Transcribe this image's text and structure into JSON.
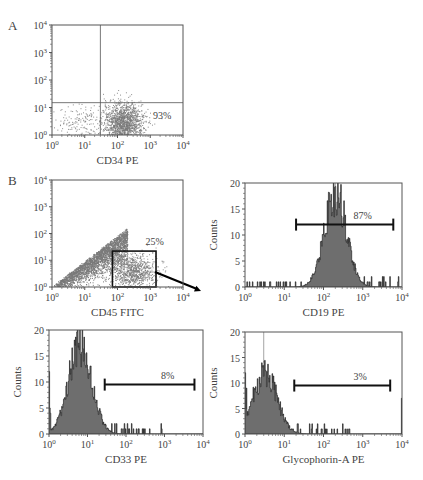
{
  "figure": {
    "panel_labels": [
      "A",
      "B"
    ],
    "colors": {
      "frame": "#555555",
      "scatter": "#7a7a7a",
      "hist_fill": "#6e6e6e",
      "hist_edge": "#111111",
      "gate": "#111111",
      "text": "#444444"
    }
  },
  "chart_data": [
    {
      "id": "A",
      "type": "scatter",
      "panel_label": "A",
      "title": "",
      "xlabel": "CD34 PE",
      "ylabel": "",
      "xscale": "log",
      "yscale": "log",
      "xlim": [
        1,
        10000
      ],
      "ylim": [
        1,
        10000
      ],
      "xticks": [
        "10^0",
        "10^1",
        "10^2",
        "10^3",
        "10^4"
      ],
      "yticks": [
        "10^0",
        "10^1",
        "10^2",
        "10^3",
        "10^4"
      ],
      "quadrant_lines": {
        "x": 30,
        "y": 15
      },
      "annotation": {
        "text": "93%",
        "quadrant": "lower-right"
      },
      "populations": [
        {
          "name": "main cluster",
          "center_x": 150,
          "center_y": 3,
          "spread_decades_x": 0.3,
          "spread_decades_y": 0.35,
          "n": 1400
        },
        {
          "name": "low tail",
          "center_x": 8,
          "center_y": 3,
          "spread_decades_x": 0.45,
          "spread_decades_y": 0.3,
          "n": 160
        }
      ]
    },
    {
      "id": "B1",
      "type": "scatter",
      "panel_label": "B",
      "title": "",
      "xlabel": "CD45 FITC",
      "ylabel": "",
      "xscale": "log",
      "yscale": "log",
      "xlim": [
        1,
        10000
      ],
      "ylim": [
        1,
        10000
      ],
      "xticks": [
        "10^0",
        "10^1",
        "10^2",
        "10^3",
        "10^4"
      ],
      "yticks": [
        "10^0",
        "10^1",
        "10^2",
        "10^3",
        "10^4"
      ],
      "gate": {
        "x0": 70,
        "x1": 1500,
        "y0": 1,
        "y1": 22,
        "label": "25%"
      },
      "arrow": {
        "from": "gate",
        "to": "CD19 PE histogram"
      },
      "populations": [
        {
          "name": "diagonal band",
          "type": "diagonal",
          "x_range": [
            1,
            200
          ],
          "n": 2600
        },
        {
          "name": "gated cluster",
          "center_x": 300,
          "center_y": 4,
          "spread_decades_x": 0.35,
          "spread_decades_y": 0.3,
          "n": 900
        }
      ]
    },
    {
      "id": "B2",
      "type": "histogram",
      "title": "",
      "xlabel": "CD19 PE",
      "ylabel": "Counts",
      "xscale": "log",
      "xlim": [
        1,
        10000
      ],
      "ylim": [
        0,
        20
      ],
      "xticks": [
        "10^0",
        "10^1",
        "10^2",
        "10^3",
        "10^4"
      ],
      "yticks": [
        0,
        5,
        10,
        15,
        20
      ],
      "marker": {
        "x0": 20,
        "x1": 6000,
        "y": 12,
        "label": "87%"
      },
      "peak": {
        "x": 200,
        "count": 19
      },
      "shape": {
        "mode_log": 2.3,
        "sigma_log": 0.28,
        "peak": 18,
        "tail_level": 1
      }
    },
    {
      "id": "B3",
      "type": "histogram",
      "title": "",
      "xlabel": "CD33 PE",
      "ylabel": "Counts",
      "xscale": "log",
      "xlim": [
        1,
        10000
      ],
      "ylim": [
        0,
        20
      ],
      "xticks": [
        "10^0",
        "10^1",
        "10^2",
        "10^3",
        "10^4"
      ],
      "yticks": [
        0,
        5,
        10,
        15,
        20
      ],
      "marker": {
        "x0": 28,
        "x1": 6000,
        "y": 9.5,
        "label": "8%"
      },
      "peak": {
        "x": 6,
        "count": 20
      },
      "shape": {
        "mode_log": 0.8,
        "sigma_log": 0.3,
        "peak": 17,
        "tail_level": 1
      }
    },
    {
      "id": "B4",
      "type": "histogram",
      "title": "",
      "xlabel": "Glycophorin-A PE",
      "ylabel": "Counts",
      "xscale": "log",
      "xlim": [
        1,
        10000
      ],
      "ylim": [
        0,
        20
      ],
      "xticks": [
        "10^0",
        "10^1",
        "10^2",
        "10^3",
        "10^4"
      ],
      "yticks": [
        0,
        5,
        10,
        15,
        20
      ],
      "marker": {
        "x0": 18,
        "x1": 5000,
        "y": 9.5,
        "label": "3%"
      },
      "peak": {
        "x": 3,
        "count": 17
      },
      "shape": {
        "mode_log": 0.5,
        "sigma_log": 0.3,
        "peak": 12,
        "tail_level": 1
      }
    }
  ],
  "layout": {
    "panels": {
      "A": {
        "x": 52,
        "y": 25,
        "w": 131,
        "h": 110
      },
      "B1": {
        "x": 52,
        "y": 180,
        "w": 131,
        "h": 107
      },
      "B2": {
        "x": 245,
        "y": 183,
        "w": 157,
        "h": 104
      },
      "B3": {
        "x": 49,
        "y": 330,
        "w": 154,
        "h": 104
      },
      "B4": {
        "x": 245,
        "y": 332,
        "w": 157,
        "h": 102
      }
    }
  }
}
